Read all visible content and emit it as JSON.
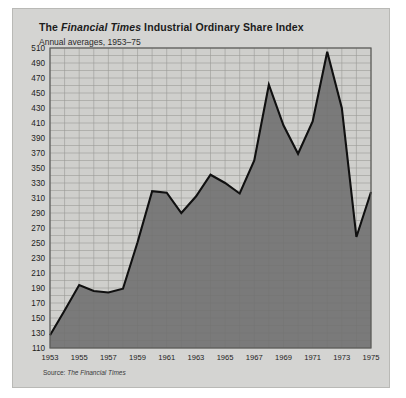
{
  "card": {
    "title_prefix": "The ",
    "title_italic": "Financial Times",
    "title_suffix": " Industrial Ordinary Share Index",
    "subtitle": "Annual averages, 1953–75",
    "source_prefix": "Source: ",
    "source_italic": "The Financial Times",
    "background_color": "#d4d4d2",
    "plot_background_color": "#cfcfcc",
    "area_fill_color": "#6e6e6e",
    "line_color": "#101010",
    "grid_color": "#9a9a97"
  },
  "chart_data": {
    "type": "area",
    "title": "The Financial Times Industrial Ordinary Share Index",
    "subtitle": "Annual averages, 1953–75",
    "source": "Source: The Financial Times",
    "xlabel": "",
    "ylabel": "",
    "grid": true,
    "legend": "none",
    "xlim": [
      1953,
      1975
    ],
    "ylim": [
      110,
      510
    ],
    "ytick_step": 20,
    "yticks": [
      110,
      130,
      150,
      170,
      190,
      210,
      230,
      250,
      270,
      290,
      310,
      330,
      350,
      370,
      390,
      410,
      430,
      450,
      470,
      490,
      510
    ],
    "ytick_labels": [
      "110",
      "130",
      "150",
      "170",
      "190",
      "210",
      "230",
      "250",
      "270",
      "290",
      "310",
      "330",
      "350",
      "370",
      "390",
      "410",
      "430",
      "450",
      "470",
      "490",
      "510"
    ],
    "xticks": [
      1953,
      1955,
      1957,
      1959,
      1961,
      1963,
      1965,
      1967,
      1969,
      1971,
      1973,
      1975
    ],
    "xtick_labels": [
      "1953",
      "1955",
      "1957",
      "1959",
      "1961",
      "1963",
      "1965",
      "1967",
      "1969",
      "1971",
      "1973",
      "1975"
    ],
    "x": [
      1953,
      1954,
      1955,
      1956,
      1957,
      1958,
      1959,
      1960,
      1961,
      1962,
      1963,
      1964,
      1965,
      1966,
      1967,
      1968,
      1969,
      1970,
      1971,
      1972,
      1973,
      1974,
      1975
    ],
    "values": [
      127,
      160,
      194,
      186,
      184,
      189,
      251,
      319,
      317,
      290,
      312,
      341,
      330,
      316,
      360,
      461,
      407,
      369,
      412,
      505,
      430,
      258,
      318
    ],
    "series": [
      {
        "name": "FT Industrial Ordinary Share Index",
        "values": [
          127,
          160,
          194,
          186,
          184,
          189,
          251,
          319,
          317,
          290,
          312,
          341,
          330,
          316,
          360,
          461,
          407,
          369,
          412,
          505,
          430,
          258,
          318
        ]
      }
    ]
  }
}
